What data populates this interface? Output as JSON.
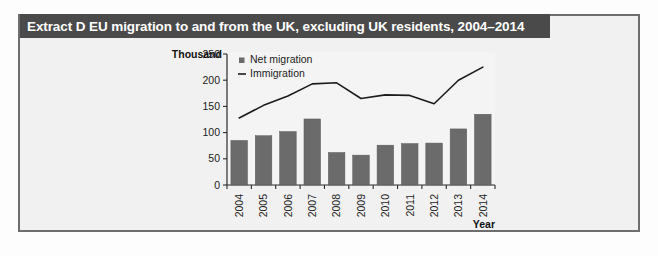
{
  "extract": {
    "title": "Extract D EU migration to and from the UK, excluding UK residents, 2004–2014",
    "header_color": "#4a4a4a",
    "frame_border_color": "#6e6e6e",
    "panel_background": "#f1f1f1"
  },
  "chart_data": {
    "type": "bar",
    "title": "",
    "subtitle": "",
    "xlabel": "Year",
    "ylabel": "Thousand",
    "categories": [
      "2004",
      "2005",
      "2006",
      "2007",
      "2008",
      "2009",
      "2010",
      "2011",
      "2012",
      "2013",
      "2014"
    ],
    "ylim": [
      0,
      250
    ],
    "ytick_labels": [
      "0",
      "50",
      "100",
      "150",
      "200",
      "250"
    ],
    "ytick_values": [
      0,
      50,
      100,
      150,
      200,
      250
    ],
    "grid": false,
    "legend_position": "top-left",
    "series": [
      {
        "name": "Net migration",
        "type": "bar",
        "color": "#6b6b6b",
        "values": [
          85,
          94,
          102,
          126,
          62,
          57,
          76,
          79,
          80,
          107,
          135
        ]
      },
      {
        "name": "Immigration",
        "type": "line",
        "color": "#1c1c1c",
        "values": [
          128,
          152,
          170,
          193,
          195,
          165,
          172,
          171,
          155,
          200,
          225
        ]
      }
    ]
  },
  "legend": {
    "items": [
      {
        "label": "Net migration",
        "marker": "square"
      },
      {
        "label": "Immigration",
        "marker": "line"
      }
    ]
  },
  "axes": {
    "y_axis_title": "Thousand",
    "x_axis_title": "Year"
  }
}
